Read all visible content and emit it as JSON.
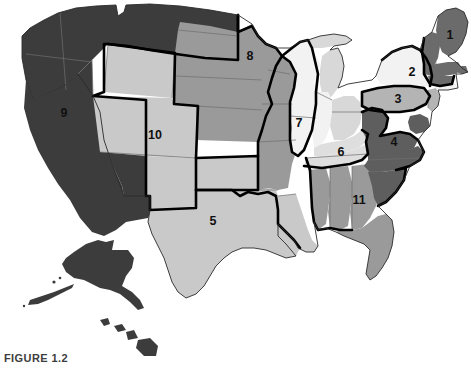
{
  "figure": {
    "caption": "FIGURE 1.2",
    "caption_visible_fragment": "FIGURE 1.2"
  },
  "map": {
    "title": "United States regions map",
    "background_color": "#ffffff",
    "border_color": "#000000",
    "state_line_color": "#6e6e6e",
    "labels": [
      {
        "id": "1",
        "text": "1",
        "x": 450,
        "y": 36,
        "shade": "#6b6b6b"
      },
      {
        "id": "2",
        "text": "2",
        "x": 412,
        "y": 73,
        "shade": "#f2f2f2"
      },
      {
        "id": "3",
        "text": "3",
        "x": 398,
        "y": 100,
        "shade": "#b4b4b4"
      },
      {
        "id": "4",
        "text": "4",
        "x": 394,
        "y": 143,
        "shade": "#5e5e5e"
      },
      {
        "id": "5",
        "text": "5",
        "x": 213,
        "y": 222,
        "shade": "#c9c9c9"
      },
      {
        "id": "6",
        "text": "6",
        "x": 341,
        "y": 153,
        "shade": "#dedede"
      },
      {
        "id": "7",
        "text": "7",
        "x": 299,
        "y": 124,
        "shade": "#f2f2f2"
      },
      {
        "id": "8",
        "text": "8",
        "x": 250,
        "y": 57,
        "shade": "#9a9a9a"
      },
      {
        "id": "9",
        "text": "9",
        "x": 64,
        "y": 114,
        "shade": "#3c3c3c"
      },
      {
        "id": "10",
        "text": "10",
        "x": 155,
        "y": 136,
        "shade": "#c9c9c9"
      },
      {
        "id": "11",
        "text": "11",
        "x": 359,
        "y": 201,
        "shade": "#9a9a9a"
      }
    ],
    "shades": {
      "darkest": "#3c3c3c",
      "dark": "#5e5e5e",
      "dark_alt": "#6b6b6b",
      "medium": "#9a9a9a",
      "medium_light": "#b4b4b4",
      "light": "#c9c9c9",
      "lighter": "#dedede",
      "lightest": "#f2f2f2"
    },
    "insets": [
      {
        "name": "alaska",
        "shade": "#3c3c3c"
      },
      {
        "name": "hawaii",
        "shade": "#3c3c3c"
      }
    ]
  }
}
